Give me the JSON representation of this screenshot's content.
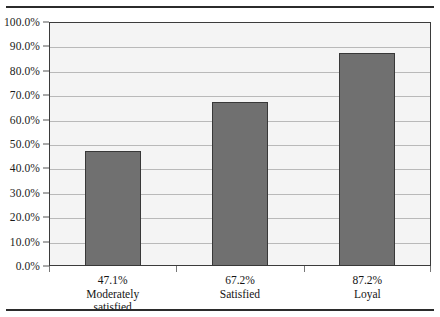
{
  "figure": {
    "rule_top": "horizontal-rule",
    "rule_bottom": "horizontal-rule"
  },
  "chart_data": {
    "type": "bar",
    "title": "",
    "subtitle": "",
    "xlabel": "",
    "ylabel": "",
    "categories": [
      "Moderately satisfied",
      "Satisfied",
      "Loyal"
    ],
    "values": [
      47.1,
      67.2,
      87.2
    ],
    "value_labels": [
      "47.1%",
      "67.2%",
      "87.2%"
    ],
    "category_lines": [
      [
        "Moderately",
        "satisfied"
      ],
      [
        "Satisfied"
      ],
      [
        "Loyal"
      ]
    ],
    "ylim": [
      0,
      100
    ],
    "ytick_step": 10,
    "ytick_labels": [
      "100.0%",
      "90.0%",
      "80.0%",
      "70.0%",
      "60.0%",
      "50.0%",
      "40.0%",
      "30.0%",
      "20.0%",
      "10.0%",
      "0.0%"
    ],
    "ytick_values": [
      100,
      90,
      80,
      70,
      60,
      50,
      40,
      30,
      20,
      10,
      0
    ],
    "grid": true,
    "grid_axis": "y",
    "legend": false,
    "legend_position": "none",
    "series": [
      {
        "name": "",
        "values": [
          47.1,
          67.2,
          87.2
        ]
      }
    ]
  },
  "style": {
    "bar_fill": "#707070",
    "bar_border": "#383838",
    "plot_background": "#f4f4f4",
    "plot_border": "#3b3b3b",
    "gridline_color": "#b9b9b9",
    "text_color": "#141414",
    "rule_color": "#2b2b2b",
    "page_background": "#ffffff"
  }
}
